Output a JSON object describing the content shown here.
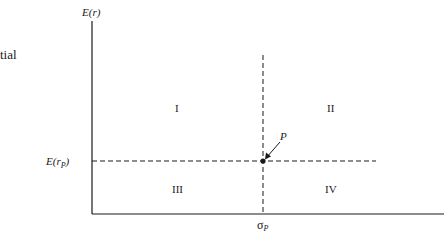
{
  "side_text": "tial",
  "diagram": {
    "y_axis_label_main": "E(r)",
    "y_marker_label_prefix": "E(r",
    "y_marker_label_sub": "P",
    "y_marker_label_suffix": ")",
    "x_marker_label_main": "σ",
    "x_marker_label_sub": "P",
    "point_label": "P",
    "quadrants": [
      "I",
      "II",
      "III",
      "IV"
    ],
    "line_color": "#1a1a1a"
  }
}
